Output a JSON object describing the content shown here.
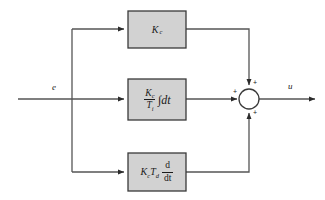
{
  "diagram": {
    "type": "control-block-diagram",
    "colors": {
      "block_fill": "#d2d2d2",
      "block_border": "#3a3a3a",
      "line": "#555555",
      "text": "#1a1a1a",
      "background": "#ffffff"
    },
    "signals": {
      "input_label": "e",
      "output_label": "u"
    },
    "blocks": [
      {
        "id": "proportional",
        "name": "proportional-gain-block",
        "gain_symbol": "K",
        "gain_subscript": "c",
        "expression": "K_c"
      },
      {
        "id": "integral",
        "name": "integral-action-block",
        "numerator_symbol": "K",
        "numerator_subscript": "c",
        "denominator_symbol": "T",
        "denominator_subscript": "i",
        "operator": "∫dt",
        "expression": "(K_c / T_i) ∫ dt"
      },
      {
        "id": "derivative",
        "name": "derivative-action-block",
        "gain_symbol": "K",
        "gain_subscript": "c",
        "time_symbol": "T",
        "time_subscript": "d",
        "operator_numerator": "d",
        "operator_denominator": "dt",
        "expression": "K_c T_d d/dt"
      }
    ],
    "summing_junction": {
      "name": "summing-junction",
      "signs": [
        {
          "position": "top",
          "symbol": "+"
        },
        {
          "position": "left",
          "symbol": "+"
        },
        {
          "position": "bottom",
          "symbol": "+"
        }
      ]
    }
  }
}
